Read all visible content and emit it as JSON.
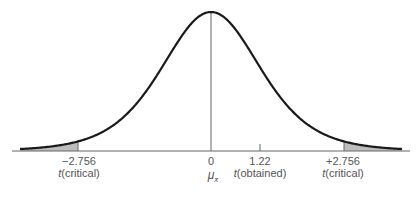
{
  "chart_data": {
    "type": "area",
    "title": "",
    "xlabel": "",
    "ylabel": "",
    "grid": false,
    "legend": null,
    "distribution": {
      "center": 0,
      "critical_value": 2.756,
      "obtained": 1.22
    },
    "shaded_regions": [
      {
        "name": "left-tail",
        "from": "-inf",
        "to": -2.756
      },
      {
        "name": "right-tail",
        "from": 2.756,
        "to": "inf"
      }
    ],
    "ticks": [
      {
        "value": -2.756,
        "label": "−2.756",
        "sublabel": "t(critical)"
      },
      {
        "value": 0,
        "label": "0",
        "sublabel": "μ_x̄"
      },
      {
        "value": 1.22,
        "label": "1.22",
        "sublabel": "t(obtained)"
      },
      {
        "value": 2.756,
        "label": "+2.756",
        "sublabel": "t(critical)"
      }
    ]
  },
  "labels": {
    "left_crit_value": "−2.756",
    "left_crit_name": "critical",
    "zero_value": "0",
    "mu_symbol": "μ",
    "mu_sub": "x̄",
    "obtained_value": "1.22",
    "obtained_name": "obtained",
    "right_crit_value": "+2.756",
    "right_crit_name": "critical",
    "t_letter": "t"
  },
  "colors": {
    "curve": "#1a1a1a",
    "axis": "#666666",
    "shade": "#bdbdbd"
  }
}
